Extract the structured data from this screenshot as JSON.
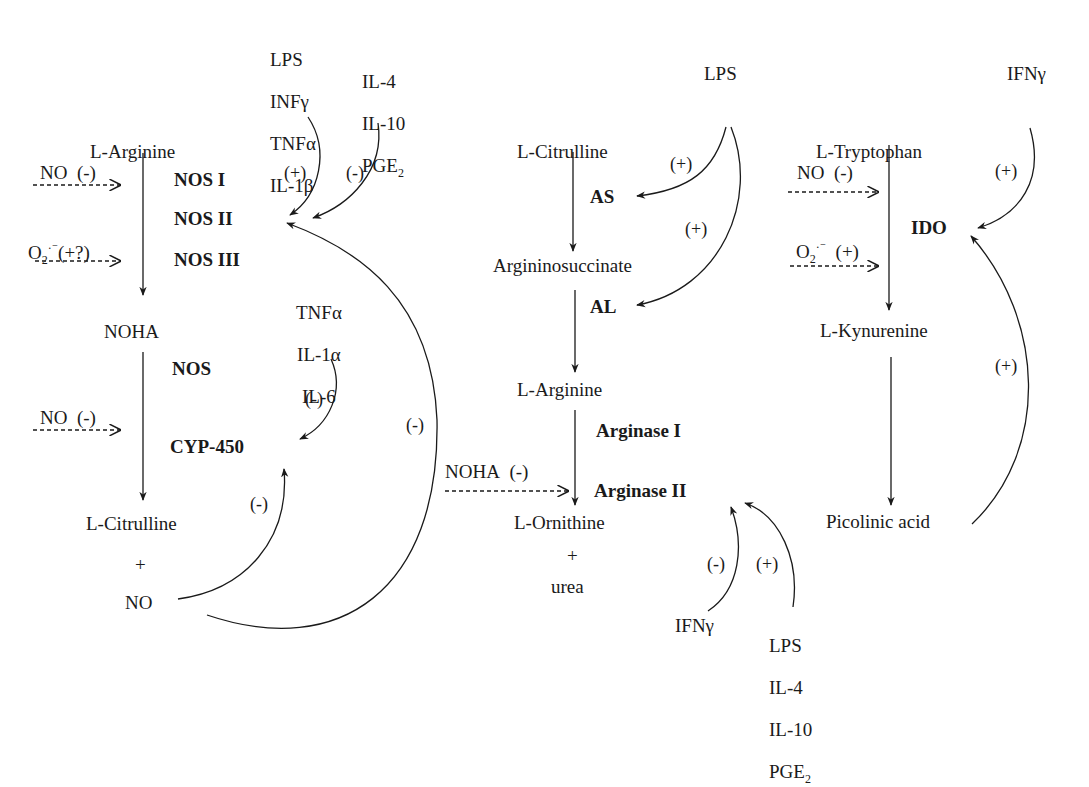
{
  "figure": {
    "left_pathway": {
      "substrate": "L-Arginine",
      "enzymes_1": [
        "NOS I",
        "NOS II",
        "NOS III"
      ],
      "intermediate": "NOHA",
      "enzyme_2": "NOS",
      "enzyme_3": "CYP-450",
      "product_1": "L-Citrulline",
      "plus": "+",
      "product_2": "NO",
      "inhibitor_no": {
        "label": "NO",
        "sign": "(-)"
      },
      "superoxide": {
        "label": "O",
        "sub": "2",
        "sup": "·⁻",
        "sign": "(+?)"
      },
      "inhibitor_no_2": {
        "label": "NO",
        "sign": "(-)"
      },
      "activators": [
        "LPS",
        "INFγ",
        "TNFα",
        "IL-1β"
      ],
      "activators_sign": "(+)",
      "suppressors": [
        "IL-4",
        "IL-10",
        "PGE"
      ],
      "suppressors_last_sub": "2",
      "suppressors_sign": "(-)",
      "cyp_inhibitors": [
        "TNFα",
        "IL-1α",
        "IL-6"
      ],
      "cyp_inhibitors_sign": "(-)",
      "no_to_cyp_sign": "(-)",
      "no_to_nos2_sign": "(-)"
    },
    "middle_pathway": {
      "substrate": "L-Citrulline",
      "enzyme_1": "AS",
      "intermediate_1": "Argininosuccinate",
      "enzyme_2": "AL",
      "intermediate_2": "L-Arginine",
      "enzyme_3a": "Arginase I",
      "enzyme_3b": "Arginase II",
      "product_1": "L-Ornithine",
      "plus": "+",
      "product_2": "urea",
      "lps": "LPS",
      "lps_to_as_sign": "(+)",
      "lps_to_al_sign": "(+)",
      "noha_inhibitor": {
        "label": "NOHA",
        "sign": "(-)"
      },
      "ifn_inhibitor": "IFNγ",
      "ifn_sign": "(-)",
      "arginase_activators": [
        "LPS",
        "IL-4",
        "IL-10",
        "PGE"
      ],
      "arginase_activators_last_sub": "2",
      "arginase_activators_sign": "(+)"
    },
    "right_pathway": {
      "substrate": "L-Tryptophan",
      "enzyme": "IDO",
      "intermediate": "L-Kynurenine",
      "product": "Picolinic acid",
      "inhibitor_no": {
        "label": "NO",
        "sign": "(-)"
      },
      "superoxide": {
        "label": "O",
        "sub": "2",
        "sup": "·⁻",
        "sign": "(+)"
      },
      "ifn_activator": "IFNγ",
      "ifn_sign": "(+)",
      "picolinic_feedback_sign": "(+)"
    }
  }
}
